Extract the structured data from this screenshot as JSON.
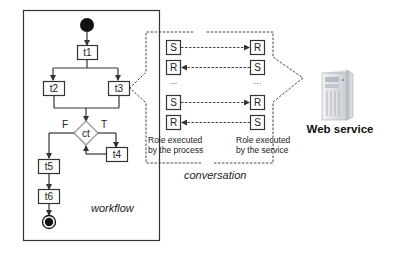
{
  "workflow": {
    "label": "workflow",
    "tasks": {
      "t1": "t1",
      "t2": "t2",
      "t3": "t3",
      "t4": "t4",
      "t5": "t5",
      "t6": "t6"
    },
    "condition": {
      "label": "ct",
      "false_label": "F",
      "true_label": "T"
    }
  },
  "conversation": {
    "label": "conversation",
    "process_column_caption_line1": "Role executed",
    "process_column_caption_line2": "by the process",
    "service_column_caption_line1": "Role executed",
    "service_column_caption_line2": "by the service",
    "rows": [
      {
        "left": "S",
        "right": "R",
        "direction": "right"
      },
      {
        "left": "R",
        "right": "S",
        "direction": "left"
      },
      {
        "left": "...",
        "right": "...",
        "direction": "none"
      },
      {
        "left": "S",
        "right": "R",
        "direction": "right"
      },
      {
        "left": "R",
        "right": "S",
        "direction": "left"
      }
    ],
    "ellipsis": "..."
  },
  "web_service": {
    "label": "Web service",
    "icon": "server-icon"
  },
  "colors": {
    "line": "#333333",
    "server_light": "#e6e8ec",
    "server_dark": "#9aa0aa"
  }
}
